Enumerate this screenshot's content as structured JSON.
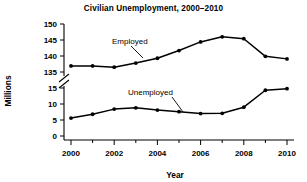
{
  "chart_data": {
    "type": "line",
    "title": "Civilian Unemployment, 2000–2010",
    "xlabel": "Year",
    "ylabel": "Millions",
    "x": [
      2000,
      2001,
      2002,
      2003,
      2004,
      2005,
      2006,
      2007,
      2008,
      2009,
      2010
    ],
    "categories": [
      "2000",
      "2001",
      "2002",
      "2003",
      "2004",
      "2005",
      "2006",
      "2007",
      "2008",
      "2009",
      "2010"
    ],
    "xtick_labels": [
      "2000",
      "2002",
      "2004",
      "2006",
      "2008",
      "2010"
    ],
    "xlim": [
      2000,
      2010
    ],
    "grid": false,
    "legend_position": "inline-annotations",
    "axis_break": {
      "present": true,
      "between": [
        135,
        15
      ],
      "upper_ticks": [
        135,
        140,
        145,
        150
      ],
      "lower_ticks": [
        0,
        5,
        10,
        15
      ]
    },
    "ytick_labels": [
      "150",
      "145",
      "140",
      "135",
      "15",
      "10",
      "5",
      "0"
    ],
    "series": [
      {
        "name": "Employed",
        "label": "Employed",
        "values": [
          136.9,
          136.9,
          136.5,
          137.8,
          139.3,
          141.7,
          144.4,
          146.0,
          145.4,
          139.9,
          139.1
        ]
      },
      {
        "name": "Unemployed",
        "label": "Unemployed",
        "values": [
          5.6,
          6.8,
          8.4,
          8.8,
          8.1,
          7.6,
          7.0,
          7.1,
          9.0,
          14.3,
          14.8
        ]
      }
    ],
    "annotations": [
      {
        "text": "Employed",
        "points_to_year": 2004
      },
      {
        "text": "Unemployed",
        "points_to_year": 2006
      }
    ]
  }
}
